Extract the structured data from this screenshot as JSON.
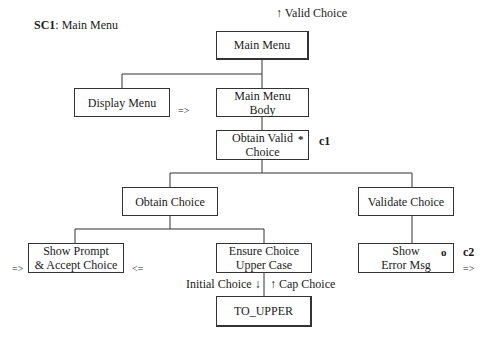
{
  "title": {
    "code": "SC1",
    "text": ": Main Menu"
  },
  "nodes": {
    "main_menu": {
      "label": "Main Menu",
      "flow_out": "↑ Valid Choice"
    },
    "display_menu": {
      "label": "Display Menu",
      "flag": "=>"
    },
    "main_menu_body": {
      "line1": "Main Menu",
      "line2": "Body"
    },
    "obtain_valid_choice": {
      "line1": "Obtain Valid",
      "line2": "Choice",
      "iteration_mark": "*",
      "condition": "c1"
    },
    "obtain_choice": {
      "label": "Obtain Choice"
    },
    "validate_choice": {
      "label": "Validate Choice"
    },
    "show_prompt": {
      "line1": "Show Prompt",
      "line2": "& Accept Choice",
      "flag_in": "=>",
      "flag_out": "<="
    },
    "ensure_upper": {
      "line1": "Ensure Choice",
      "line2": "Upper Case",
      "flow_down": "Initial Choice ↓",
      "flow_up": "↑ Cap Choice"
    },
    "show_error": {
      "line1": "Show",
      "line2": "Error Msg",
      "selection_mark": "o",
      "condition": "c2",
      "flag": "=>"
    },
    "to_upper": {
      "label": "TO_UPPER"
    }
  }
}
